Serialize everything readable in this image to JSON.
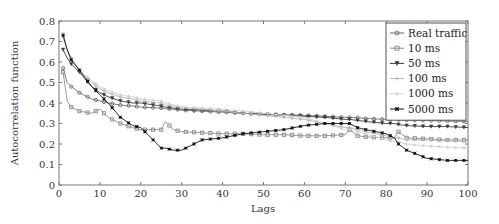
{
  "chart_data": {
    "type": "line",
    "title": "",
    "xlabel": "Lags",
    "ylabel": "Autocorrelation function",
    "xlim": [
      0,
      100
    ],
    "ylim": [
      0,
      0.8
    ],
    "xticks": [
      0,
      10,
      20,
      30,
      40,
      50,
      60,
      70,
      80,
      90,
      100
    ],
    "yticks": [
      0,
      0.1,
      0.2,
      0.3,
      0.4,
      0.5,
      0.6,
      0.7,
      0.8
    ],
    "ytick_labels": [
      "0",
      "0.1",
      "0.2",
      "0.3",
      "0.4",
      "0.5",
      "0.6",
      "0.7",
      "0.8"
    ],
    "grid": false,
    "legend_position": "upper right",
    "x": [
      1,
      2,
      3,
      5,
      8,
      10,
      12,
      15,
      18,
      20,
      25,
      26,
      28,
      30,
      35,
      40,
      45,
      50,
      55,
      60,
      65,
      70,
      71,
      73,
      75,
      80,
      82,
      83,
      85,
      90,
      95,
      100
    ],
    "series": [
      {
        "name": "Real traffic",
        "color": "#6a6a6a",
        "marker": "circle",
        "values": [
          0.57,
          0.5,
          0.48,
          0.45,
          0.42,
          0.41,
          0.4,
          0.39,
          0.385,
          0.38,
          0.375,
          0.372,
          0.37,
          0.365,
          0.36,
          0.355,
          0.35,
          0.345,
          0.342,
          0.34,
          0.335,
          0.33,
          0.33,
          0.328,
          0.325,
          0.32,
          0.32,
          0.318,
          0.317,
          0.315,
          0.312,
          0.31
        ]
      },
      {
        "name": "10 ms",
        "color": "#8c8c8c",
        "marker": "square",
        "values": [
          0.55,
          0.41,
          0.38,
          0.36,
          0.35,
          0.37,
          0.33,
          0.3,
          0.28,
          0.27,
          0.27,
          0.31,
          0.27,
          0.26,
          0.255,
          0.25,
          0.25,
          0.245,
          0.245,
          0.24,
          0.24,
          0.245,
          0.27,
          0.24,
          0.235,
          0.23,
          0.23,
          0.26,
          0.23,
          0.225,
          0.22,
          0.22
        ]
      },
      {
        "name": "50 ms",
        "color": "#3a3a3a",
        "marker": "triangle-down",
        "values": [
          0.66,
          0.62,
          0.59,
          0.55,
          0.48,
          0.45,
          0.43,
          0.41,
          0.4,
          0.4,
          0.385,
          0.38,
          0.375,
          0.37,
          0.365,
          0.36,
          0.35,
          0.345,
          0.34,
          0.335,
          0.33,
          0.32,
          0.32,
          0.315,
          0.31,
          0.3,
          0.3,
          0.295,
          0.29,
          0.285,
          0.285,
          0.28
        ]
      },
      {
        "name": "100 ms",
        "color": "#b4b4b4",
        "marker": "plus",
        "values": [
          0.74,
          0.66,
          0.62,
          0.56,
          0.5,
          0.47,
          0.45,
          0.43,
          0.42,
          0.41,
          0.4,
          0.39,
          0.385,
          0.38,
          0.37,
          0.36,
          0.35,
          0.34,
          0.33,
          0.32,
          0.3,
          0.28,
          0.28,
          0.27,
          0.26,
          0.24,
          0.23,
          0.23,
          0.22,
          0.22,
          0.215,
          0.21
        ]
      },
      {
        "name": "1000 ms",
        "color": "#cfcfcf",
        "marker": "plus",
        "values": [
          0.72,
          0.65,
          0.61,
          0.56,
          0.51,
          0.48,
          0.46,
          0.44,
          0.43,
          0.42,
          0.41,
          0.4,
          0.39,
          0.38,
          0.375,
          0.37,
          0.36,
          0.35,
          0.34,
          0.33,
          0.3,
          0.27,
          0.27,
          0.26,
          0.25,
          0.22,
          0.21,
          0.21,
          0.2,
          0.19,
          0.185,
          0.18
        ]
      },
      {
        "name": "5000 ms",
        "color": "#111111",
        "marker": "star",
        "values": [
          0.73,
          0.66,
          0.61,
          0.56,
          0.48,
          0.44,
          0.4,
          0.33,
          0.29,
          0.28,
          0.18,
          0.18,
          0.17,
          0.17,
          0.22,
          0.23,
          0.25,
          0.26,
          0.27,
          0.29,
          0.3,
          0.3,
          0.3,
          0.28,
          0.27,
          0.25,
          0.23,
          0.2,
          0.17,
          0.13,
          0.12,
          0.12
        ]
      }
    ]
  }
}
